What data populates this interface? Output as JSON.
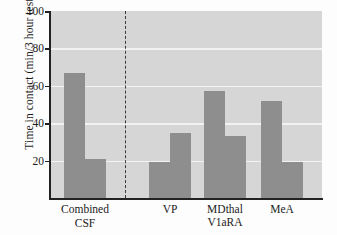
{
  "chart_data": {
    "type": "bar",
    "title": "",
    "xlabel": "",
    "ylabel": "Time in contact (min/3 hour test)",
    "ylim": [
      0,
      100
    ],
    "yticks": [
      20,
      40,
      60,
      80,
      100
    ],
    "ytick_labels": [
      "20",
      "40",
      "60",
      "80",
      "100"
    ],
    "grid": true,
    "legend": false,
    "categories": [
      "Combined CSF",
      "VP",
      "MDthal",
      "MeA"
    ],
    "group_label": "V1aRA",
    "divider_after_category": "Combined CSF",
    "bars": [
      {
        "category": "Combined CSF",
        "pair_index": 0,
        "value": 67
      },
      {
        "category": "Combined CSF",
        "pair_index": 1,
        "value": 21
      },
      {
        "category": "VP",
        "pair_index": 0,
        "value": 19
      },
      {
        "category": "VP",
        "pair_index": 1,
        "value": 35
      },
      {
        "category": "MDthal",
        "pair_index": 0,
        "value": 57
      },
      {
        "category": "MDthal",
        "pair_index": 1,
        "value": 33
      },
      {
        "category": "MeA",
        "pair_index": 0,
        "value": 52
      },
      {
        "category": "MeA",
        "pair_index": 1,
        "value": 19
      }
    ],
    "series": [
      {
        "name": "first",
        "values": [
          67,
          19,
          57,
          52
        ]
      },
      {
        "name": "second",
        "values": [
          21,
          35,
          33,
          19
        ]
      }
    ],
    "colors": {
      "bar": "#8e8e8e",
      "plot_background": "#d6d6d6",
      "gridline": "#f2f2f2",
      "axis": "#222222",
      "divider": "#3a3a3a",
      "text": "#1b1b1b"
    }
  },
  "xlabels": [
    {
      "line1": "Combined",
      "line2": "CSF"
    },
    {
      "line1": "VP",
      "line2": ""
    },
    {
      "line1": "MDthal",
      "line2": ""
    },
    {
      "line1": "MeA",
      "line2": ""
    }
  ],
  "group_label": "V1aRA"
}
